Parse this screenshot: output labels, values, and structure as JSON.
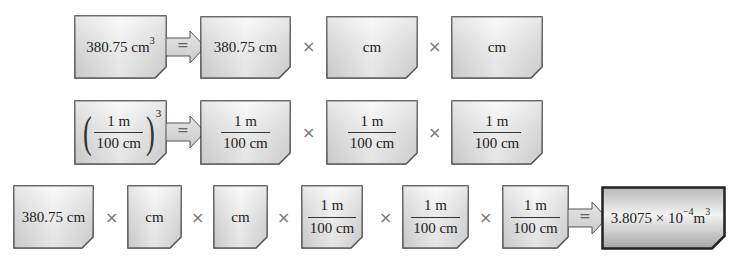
{
  "colors": {
    "box_light": "#f4f4f4",
    "box_mid": "#d8d8d8",
    "box_border": "#3a3a3a",
    "result_light": "#eaeaea",
    "result_dark": "#a8a8a8",
    "arrow_fill": "#d9d9d9",
    "times_color": "#777777"
  },
  "operators": {
    "times": "×",
    "equals": "="
  },
  "row1": {
    "lhs": {
      "value": "380.75 cm",
      "exponent": "3"
    },
    "rhs": [
      {
        "value": "380.75 cm"
      },
      {
        "value": "cm"
      },
      {
        "value": "cm"
      }
    ]
  },
  "row2": {
    "lhs": {
      "numerator": "1 m",
      "denominator": "100 cm",
      "exponent": "3"
    },
    "rhs": [
      {
        "numerator": "1 m",
        "denominator": "100 cm"
      },
      {
        "numerator": "1 m",
        "denominator": "100 cm"
      },
      {
        "numerator": "1 m",
        "denominator": "100 cm"
      }
    ]
  },
  "row3": {
    "factors": [
      {
        "value": "380.75 cm"
      },
      {
        "value": "cm"
      },
      {
        "value": "cm"
      },
      {
        "numerator": "1 m",
        "denominator": "100 cm"
      },
      {
        "numerator": "1 m",
        "denominator": "100 cm"
      },
      {
        "numerator": "1 m",
        "denominator": "100 cm"
      }
    ],
    "result": {
      "mantissa": "3.8075 × 10",
      "exponent": "−4",
      "unit": " m",
      "unit_exponent": "3"
    }
  }
}
